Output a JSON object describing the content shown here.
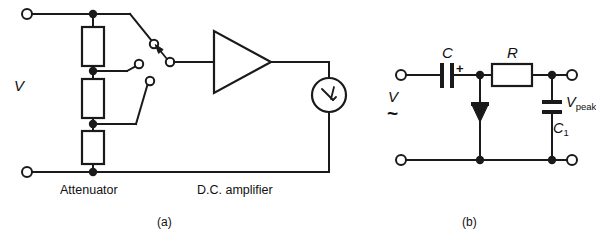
{
  "figure": {
    "background_color": "#ffffff",
    "line_color": "#1a1a1a",
    "panels": [
      {
        "key": "a",
        "caption": "(a)",
        "title_labels": [
          "Attenuator",
          "D.C. amplifier"
        ],
        "source_label": "V"
      },
      {
        "key": "b",
        "caption": "(b)",
        "source_label": "V",
        "source_type_symbol": "~"
      }
    ]
  },
  "panel_a": {
    "caption": "(a)",
    "source_label": "V",
    "attenuator_label": "Attenuator",
    "amplifier_label": "D.C. amplifier",
    "resistors": [
      {
        "name": "attenuator-resistor-top"
      },
      {
        "name": "attenuator-resistor-middle"
      },
      {
        "name": "attenuator-resistor-bottom"
      }
    ],
    "switch": {
      "name": "attenuator-range-switch",
      "poles": 3,
      "selected_tap": "top"
    },
    "amplifier": {
      "name": "dc-amplifier",
      "shape": "triangle"
    },
    "meter": {
      "name": "panel-meter",
      "symbol": "needle"
    },
    "terminals": [
      {
        "name": "input-terminal-top"
      },
      {
        "name": "input-terminal-bottom"
      }
    ]
  },
  "panel_b": {
    "caption": "(b)",
    "source_label": "V",
    "source_type_symbol": "~",
    "capacitor_label": "C",
    "capacitor_polarity": "+",
    "resistor_label": "R",
    "smoothing_capacitor_label_main": "C",
    "smoothing_capacitor_label_sub": "1",
    "output_voltage_label_main": "V",
    "output_voltage_label_sub": "peak",
    "diode": {
      "name": "rectifier-diode",
      "orientation": "cathode-down"
    },
    "terminals": [
      {
        "name": "input-terminal-top"
      },
      {
        "name": "input-terminal-bottom"
      },
      {
        "name": "output-terminal-top"
      },
      {
        "name": "output-terminal-bottom"
      }
    ]
  }
}
